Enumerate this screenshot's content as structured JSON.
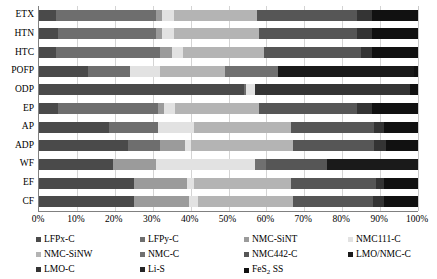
{
  "chart_data": {
    "type": "bar",
    "orientation": "horizontal",
    "stacked": true,
    "normalized": true,
    "title": "",
    "subtitle": "",
    "xlabel": "",
    "ylabel": "",
    "xlim": [
      0,
      100
    ],
    "xunit": "%",
    "grid": true,
    "legend_position": "bottom",
    "xticks": [
      "0%",
      "10%",
      "20%",
      "30%",
      "40%",
      "50%",
      "60%",
      "70%",
      "80%",
      "90%",
      "100%"
    ],
    "xtick_values": [
      0,
      10,
      20,
      30,
      40,
      50,
      60,
      70,
      80,
      90,
      100
    ],
    "categories": [
      "ETX",
      "HTN",
      "HTC",
      "POFP",
      "ODP",
      "EP",
      "AP",
      "ADP",
      "WF",
      "EF",
      "CF"
    ],
    "series": [
      {
        "name": "LFPx-C",
        "color": "#4a4a4a",
        "values": [
          4.5,
          5.0,
          4.5,
          13.0,
          54.0,
          5.0,
          18.5,
          23.5,
          19.5,
          25.0,
          25.0
        ]
      },
      {
        "name": "LFPy-C",
        "color": "#6e6e6e",
        "values": [
          26.5,
          26.0,
          27.5,
          11.0,
          0.7,
          26.5,
          13.0,
          8.5,
          0.0,
          0.0,
          0.0
        ]
      },
      {
        "name": "NMC-SiNT",
        "color": "#9b9b9b",
        "values": [
          1.5,
          1.5,
          3.0,
          0.0,
          0.0,
          1.5,
          0.0,
          6.5,
          11.5,
          14.0,
          14.5
        ]
      },
      {
        "name": "NMC111-C",
        "color": "#e2e2e2",
        "values": [
          3.0,
          3.0,
          3.0,
          8.0,
          2.3,
          3.0,
          9.5,
          1.5,
          26.0,
          2.0,
          2.5
        ]
      },
      {
        "name": "NMC-SiNW",
        "color": "#b4b4b4",
        "values": [
          22.0,
          22.5,
          21.5,
          17.0,
          0.0,
          22.0,
          25.5,
          27.0,
          0.0,
          25.5,
          25.0
        ]
      },
      {
        "name": "NMC-C",
        "color": "#707070",
        "values": [
          0.0,
          0.0,
          0.0,
          14.0,
          0.0,
          0.0,
          0.0,
          0.0,
          3.0,
          0.0,
          0.0
        ]
      },
      {
        "name": "NMC442-C",
        "color": "#565656",
        "values": [
          26.5,
          26.0,
          25.5,
          0.0,
          0.0,
          26.0,
          22.0,
          21.5,
          16.0,
          22.5,
          21.0
        ]
      },
      {
        "name": "LMO/NMC-C",
        "color": "#1a1a1a",
        "values": [
          0.0,
          0.0,
          0.0,
          36.0,
          0.0,
          0.0,
          0.0,
          0.0,
          24.0,
          0.0,
          0.0
        ]
      },
      {
        "name": "LMO-C",
        "color": "#343434",
        "values": [
          4.0,
          4.0,
          3.0,
          0.0,
          41.0,
          4.0,
          2.5,
          3.0,
          0.0,
          2.0,
          3.0
        ]
      },
      {
        "name": "Li-S",
        "color": "#262626",
        "values": [
          0.0,
          0.0,
          0.0,
          0.0,
          0.0,
          0.0,
          0.0,
          0.0,
          0.0,
          0.0,
          0.0
        ]
      },
      {
        "name": "FeS2 SS",
        "color": "#111111",
        "values": [
          12.0,
          12.0,
          12.0,
          1.0,
          2.0,
          12.0,
          9.0,
          8.5,
          0.0,
          9.0,
          9.0
        ]
      }
    ]
  },
  "legend": {
    "entries": [
      {
        "label": "LFPx-C",
        "color": "#4a4a4a"
      },
      {
        "label": "LFPy-C",
        "color": "#6e6e6e"
      },
      {
        "label": "NMC-SiNT",
        "color": "#9b9b9b"
      },
      {
        "label": "NMC111-C",
        "color": "#e2e2e2"
      },
      {
        "label": "NMC-SiNW",
        "color": "#b4b4b4"
      },
      {
        "label": "NMC-C",
        "color": "#707070"
      },
      {
        "label": "NMC442-C",
        "color": "#565656"
      },
      {
        "label": "LMO/NMC-C",
        "color": "#1a1a1a"
      },
      {
        "label": "LMO-C",
        "color": "#343434"
      },
      {
        "label": "Li-S",
        "color": "#262626"
      },
      {
        "label": "FeS2 SS",
        "color": "#111111",
        "sub": {
          "base": "FeS",
          "sub": "2",
          "tail": " SS"
        }
      }
    ]
  }
}
